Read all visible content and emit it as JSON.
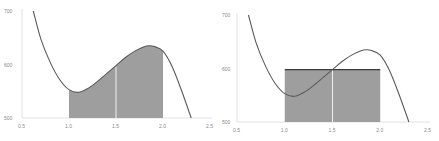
{
  "chart_data": [
    {
      "type": "area",
      "title": "",
      "xlabel": "",
      "ylabel": "",
      "xlim": [
        0.5,
        2.5
      ],
      "ylim": [
        500,
        700
      ],
      "x_ticks": [
        "0.5",
        "1.0",
        "1.5",
        "2.0",
        "2.5"
      ],
      "y_ticks": [
        "500",
        "600",
        "700"
      ],
      "grid": false,
      "curve": {
        "x": [
          0.62,
          0.7,
          0.8,
          0.9,
          1.0,
          1.1,
          1.2,
          1.3,
          1.4,
          1.5,
          1.6,
          1.7,
          1.8,
          1.85,
          1.9,
          2.0,
          2.1,
          2.2,
          2.3
        ],
        "y": [
          700,
          648,
          604,
          572,
          553,
          548,
          555,
          568,
          583,
          598,
          613,
          625,
          633,
          635,
          634,
          625,
          595,
          550,
          500
        ]
      },
      "shaded_region": {
        "x_from": 1.0,
        "x_to": 2.0,
        "kind": "area under curve"
      },
      "divider_x": 1.5
    },
    {
      "type": "area",
      "title": "",
      "xlabel": "",
      "ylabel": "",
      "xlim": [
        0.5,
        2.5
      ],
      "ylim": [
        500,
        700
      ],
      "x_ticks": [
        "0.5",
        "1.0",
        "1.5",
        "2.0",
        "2.5"
      ],
      "y_ticks": [
        "500",
        "600",
        "700"
      ],
      "grid": false,
      "curve": {
        "x": [
          0.62,
          0.7,
          0.8,
          0.9,
          1.0,
          1.1,
          1.2,
          1.3,
          1.4,
          1.5,
          1.6,
          1.7,
          1.8,
          1.85,
          1.9,
          2.0,
          2.1,
          2.2,
          2.3
        ],
        "y": [
          700,
          648,
          604,
          572,
          553,
          548,
          555,
          568,
          583,
          598,
          613,
          625,
          633,
          635,
          634,
          625,
          595,
          550,
          500
        ]
      },
      "rectangle": {
        "x_from": 1.0,
        "x_to": 2.0,
        "height": 598,
        "kind": "midpoint rectangle"
      },
      "divider_x": 1.5
    }
  ],
  "style": {
    "fill_color": "#9e9e9e",
    "curve_color": "#5a5a5a",
    "axis_color": "#e2e2e2",
    "divider_color": "#f2f2f2",
    "rect_top_color": "#3a3a3a"
  }
}
